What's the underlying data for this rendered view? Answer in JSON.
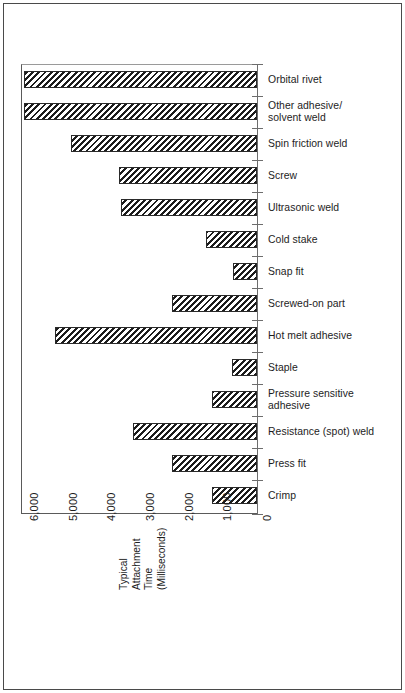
{
  "chart_data": {
    "type": "bar",
    "orientation": "horizontal",
    "title": "",
    "subtitle": "",
    "xlabel": "Typical\nAttachment\nTime\n(Milliseconds)",
    "ylabel": "",
    "xlim": [
      6500,
      0
    ],
    "x_axis_reversed": true,
    "grid": false,
    "legend": null,
    "x_tick_labels": [
      "6,000",
      "5,000",
      "4,000",
      "3,000",
      "2,000",
      "1,000",
      "0"
    ],
    "x_tick_values": [
      6000,
      5000,
      4000,
      3000,
      2000,
      1000,
      0
    ],
    "categories": [
      "Orbital rivet",
      "Other adhesive/\nsolvent weld",
      "Spin friction weld",
      "Screw",
      "Ultrasonic weld",
      "Cold stake",
      "Snap fit",
      "Screwed-on part",
      "Hot melt adhesive",
      "Staple",
      "Pressure sensitive\nadhesive",
      "Resistance (spot) weld",
      "Press fit",
      "Crimp"
    ],
    "values": [
      6000,
      6000,
      4800,
      3550,
      3500,
      1300,
      620,
      2200,
      5200,
      640,
      1150,
      3200,
      2200,
      1150
    ],
    "bar_style": {
      "fill": "diagonal-hatch",
      "hatch_color": "#1c1c1c",
      "background": "#ffffff",
      "border_color": "#2a2a2a"
    }
  },
  "axis": {
    "tick_label_orientation": "rotated-90",
    "title_orientation": "rotated-90"
  }
}
